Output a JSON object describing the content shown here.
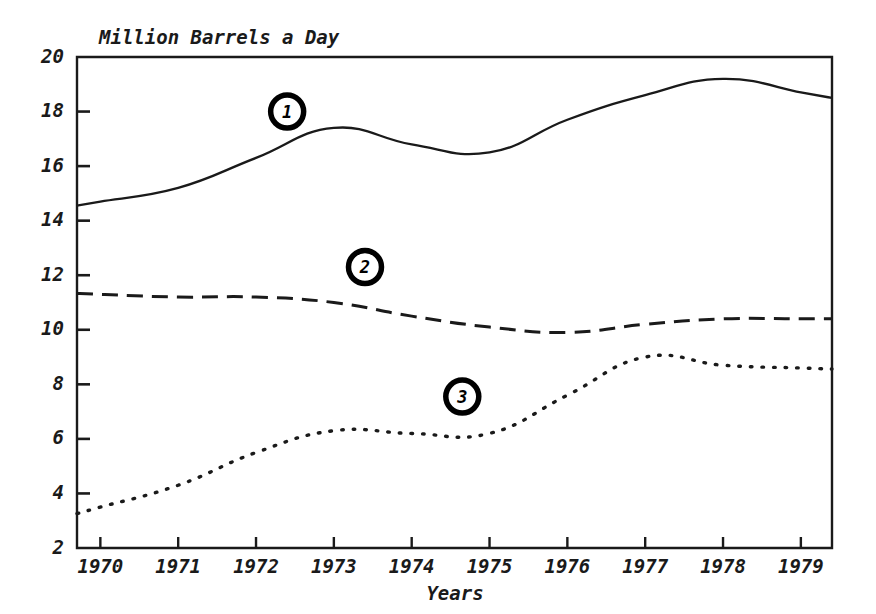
{
  "figure": {
    "name": "oil-consumption-line-chart",
    "background_color": "#ffffff",
    "ink_color": "#1a1a1a"
  },
  "chart_data": {
    "type": "line",
    "title": "",
    "subtitle": "",
    "ylabel": "Million Barrels a Day",
    "xlabel": "Years",
    "x": [
      1970,
      1971,
      1972,
      1973,
      1974,
      1975,
      1976,
      1977,
      1978,
      1979
    ],
    "categories": [
      "1970",
      "1971",
      "1972",
      "1973",
      "1974",
      "1975",
      "1976",
      "1977",
      "1978",
      "1979"
    ],
    "xlim": [
      1969.7,
      1979.4
    ],
    "ylim": [
      2,
      20
    ],
    "yticks": [
      2,
      4,
      6,
      8,
      10,
      12,
      14,
      16,
      18,
      20
    ],
    "ytick_labels": [
      "2",
      "4",
      "6",
      "8",
      "10",
      "12",
      "14",
      "16",
      "18",
      "20"
    ],
    "xticks": [
      1970,
      1971,
      1972,
      1973,
      1974,
      1975,
      1976,
      1977,
      1978,
      1979
    ],
    "grid": false,
    "legend": "inline-numbered-markers",
    "series": [
      {
        "name": "1",
        "label": "1",
        "style": "solid",
        "color": "#1a1a1a",
        "values": [
          14.7,
          15.2,
          16.3,
          17.4,
          16.8,
          16.5,
          17.7,
          18.6,
          19.2,
          18.7
        ],
        "marker_label": "1",
        "marker_x": 1972.4,
        "marker_y": 18.0
      },
      {
        "name": "2",
        "label": "2",
        "style": "dashed",
        "color": "#1a1a1a",
        "values": [
          11.3,
          11.2,
          11.2,
          11.0,
          10.5,
          10.1,
          9.9,
          10.2,
          10.4,
          10.4
        ],
        "marker_label": "2",
        "marker_x": 1973.4,
        "marker_y": 12.3
      },
      {
        "name": "3",
        "label": "3",
        "style": "dotted",
        "color": "#1a1a1a",
        "values": [
          3.5,
          4.3,
          5.5,
          6.3,
          6.2,
          6.2,
          7.6,
          9.0,
          8.7,
          8.6
        ],
        "marker_label": "3",
        "marker_x": 1974.65,
        "marker_y": 7.55
      }
    ],
    "annotations": [
      {
        "text": "1",
        "kind": "numbered-circle-marker",
        "series": "1"
      },
      {
        "text": "2",
        "kind": "numbered-circle-marker",
        "series": "2"
      },
      {
        "text": "3",
        "kind": "numbered-circle-marker",
        "series": "3"
      }
    ]
  }
}
